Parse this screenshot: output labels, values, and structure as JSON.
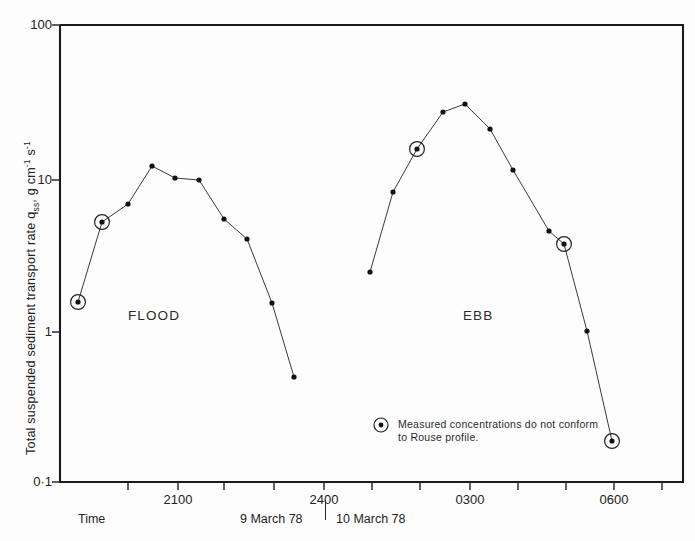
{
  "figure": {
    "background_color": "#fdfdfd",
    "axis_color": "#1b1b1b",
    "series_color": "#3a3a3a"
  },
  "axes": {
    "y_label_parts": {
      "main": "Total suspended sediment transport rate q",
      "sub": "ss",
      "tail": ", g cm",
      "sup1": "-1",
      "tail2": " s",
      "sup2": "-1"
    },
    "y_ticks": [
      "100",
      "10",
      "1",
      "0·1"
    ],
    "y_tick_values": [
      100,
      10,
      1,
      0.1
    ],
    "x_ticks": [
      "2100",
      "2400",
      "0300",
      "0600"
    ],
    "x_axis_title": "Time",
    "date_left": "9 March 78",
    "date_right": "10 March 78"
  },
  "annotations": {
    "flood_label": "FLOOD",
    "ebb_label": "EBB",
    "legend_text": "Measured  concentrations  do  not conform  to  Rouse  profile."
  },
  "chart_data": {
    "type": "line",
    "title": "",
    "xlabel": "Time",
    "ylabel": "Total suspended sediment transport rate q_ss, g cm^-1 s^-1",
    "yscale": "log",
    "ylim": [
      0.1,
      100
    ],
    "xlim": [
      "1930",
      "0630"
    ],
    "grid": false,
    "legend": "Measured concentrations do not conform to Rouse profile.",
    "series": [
      {
        "name": "FLOOD",
        "x": [
          "1945",
          "2015",
          "2045",
          "2115",
          "2145",
          "2215",
          "2245",
          "2315",
          "2345",
          "0015"
        ],
        "y": [
          1.58,
          5.3,
          6.6,
          12.4,
          10.4,
          10.1,
          6.0,
          4.5,
          1.6,
          0.51
        ],
        "flagged_indices": [
          0,
          1
        ]
      },
      {
        "name": "EBB",
        "x": [
          "0130",
          "0200",
          "0230",
          "0300",
          "0330",
          "0400",
          "0430",
          "0515",
          "0545",
          "0615",
          "0645"
        ],
        "y": [
          2.44,
          9.4,
          16.5,
          28.5,
          31.5,
          21.5,
          11.5,
          4.4,
          3.8,
          1.02,
          0.19
        ],
        "flagged_indices": [
          2,
          8,
          10
        ]
      }
    ],
    "flag_meaning": "Measured concentrations do not conform to Rouse profile."
  },
  "pixel_geometry": {
    "plot_left": 60,
    "plot_right": 683,
    "plot_top": 25,
    "plot_bottom": 482,
    "y_tick_px": [
      25,
      180,
      332,
      482
    ],
    "x_tick_px": [
      178,
      324,
      470,
      614
    ],
    "x_minor_px": [
      128,
      224,
      274,
      372,
      420,
      518,
      564,
      662
    ],
    "flood_points_px": [
      [
        78,
        302
      ],
      [
        102,
        222
      ],
      [
        128,
        204
      ],
      [
        152,
        166
      ],
      [
        175,
        178
      ],
      [
        199,
        180
      ],
      [
        224,
        219
      ],
      [
        247,
        239
      ],
      [
        272,
        303
      ],
      [
        294,
        377
      ]
    ],
    "flood_ringed_px": [
      [
        78,
        302
      ],
      [
        102,
        222
      ]
    ],
    "ebb_points_px": [
      [
        370,
        272
      ],
      [
        393,
        192
      ],
      [
        417,
        149
      ],
      [
        443,
        112
      ],
      [
        465,
        104
      ],
      [
        490,
        129
      ],
      [
        513,
        170
      ],
      [
        549,
        231
      ],
      [
        564,
        244
      ],
      [
        587,
        331
      ],
      [
        612,
        441
      ]
    ],
    "ebb_ringed_px": [
      [
        417,
        149
      ],
      [
        564,
        244
      ],
      [
        612,
        441
      ]
    ]
  }
}
